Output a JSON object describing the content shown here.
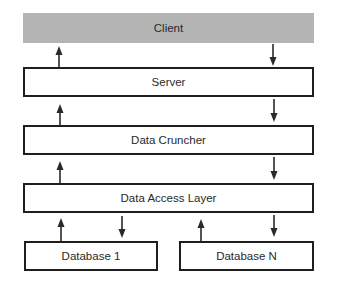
{
  "diagram": {
    "type": "layered-architecture",
    "layers": [
      {
        "id": "client",
        "label": "Client",
        "fill": "#b4b4b4"
      },
      {
        "id": "server",
        "label": "Server",
        "fill": "#ffffff"
      },
      {
        "id": "data_cruncher",
        "label": "Data Cruncher",
        "fill": "#ffffff"
      },
      {
        "id": "data_access_layer",
        "label": "Data Access Layer",
        "fill": "#ffffff"
      }
    ],
    "databases": [
      {
        "id": "database_1",
        "label": "Database 1"
      },
      {
        "id": "database_n",
        "label": "Database N"
      }
    ],
    "edges": [
      {
        "from": "server",
        "to": "client",
        "direction": "up"
      },
      {
        "from": "client",
        "to": "server",
        "direction": "down"
      },
      {
        "from": "data_cruncher",
        "to": "server",
        "direction": "up"
      },
      {
        "from": "server",
        "to": "data_cruncher",
        "direction": "down"
      },
      {
        "from": "data_access_layer",
        "to": "data_cruncher",
        "direction": "up"
      },
      {
        "from": "data_cruncher",
        "to": "data_access_layer",
        "direction": "down"
      },
      {
        "from": "database_1",
        "to": "data_access_layer",
        "direction": "up"
      },
      {
        "from": "data_access_layer",
        "to": "database_1",
        "direction": "down"
      },
      {
        "from": "database_n",
        "to": "data_access_layer",
        "direction": "up"
      },
      {
        "from": "data_access_layer",
        "to": "database_n",
        "direction": "down"
      }
    ],
    "colors": {
      "stroke": "#1e1e1e",
      "text": "#2a2a2a",
      "client_fill": "#b4b4b4",
      "background": "#ffffff"
    }
  }
}
